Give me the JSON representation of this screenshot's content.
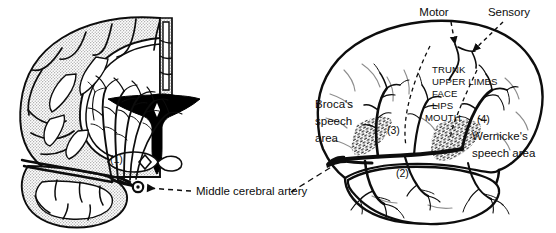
{
  "figure": {
    "background_color": "#ffffff",
    "ink_color": "#0d0d0d",
    "cortex_stipple_color": "#b8b8b8",
    "ventricle_color": "#000000"
  },
  "panels": {
    "left": {
      "name": "coronal-section",
      "description": "Coronal section of cerebral hemisphere with stippled cortex, white matter, black lateral ventricle and radiating arterial branches"
    },
    "right": {
      "name": "lateral-view",
      "description": "Lateral view of left cerebral hemisphere showing middle cerebral artery branches, speech areas and motor/sensory strip"
    }
  },
  "labels": {
    "middle_cerebral_artery": "Middle cerebral artery",
    "motor": "Motor",
    "sensory": "Sensory",
    "brocas": [
      "Broca's",
      "speech",
      "area"
    ],
    "wernickes": [
      "Wernicke's",
      "speech area"
    ],
    "homunculus": [
      "TRUNK",
      "UPPER LIMBS",
      "FACE",
      "LIPS",
      "MOUTH"
    ]
  },
  "markers": {
    "m1": "(1)",
    "m2": "(2)",
    "m3": "(3)",
    "m4": "(4)"
  }
}
